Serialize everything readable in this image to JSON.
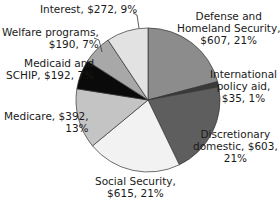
{
  "chart_data": {
    "type": "pie",
    "title": "",
    "start_angle": "12 o'clock, clockwise",
    "slices": [
      {
        "label": "Defense and Homeland Security",
        "value": 607,
        "percent": 21,
        "color": "#8c8c8c"
      },
      {
        "label": "International policy aid",
        "value": 35,
        "percent": 1,
        "color": "#3a3a3a"
      },
      {
        "label": "Discretionary domestic",
        "value": 603,
        "percent": 21,
        "color": "#5e5e5e"
      },
      {
        "label": "Social Security",
        "value": 615,
        "percent": 21,
        "color": "#f2f2f2"
      },
      {
        "label": "Medicare",
        "value": 392,
        "percent": 13,
        "color": "#c4c4c4"
      },
      {
        "label": "Medicaid and SCHIP",
        "value": 192,
        "percent": 7,
        "color": "#0a0a0a"
      },
      {
        "label": "Welfare programs",
        "value": 190,
        "percent": 7,
        "color": "#a8a8a8"
      },
      {
        "label": "Interest",
        "value": 272,
        "percent": 9,
        "color": "#e2e2e2"
      }
    ]
  },
  "labels": {
    "defense": [
      "Defense and",
      "Homeland Security,",
      "$607, 21%"
    ],
    "international": [
      "International",
      "policy aid,",
      "$35, 1%"
    ],
    "discretionary": [
      "Discretionary",
      "domestic, $603,",
      "21%"
    ],
    "social_security": [
      "Social Security,",
      "$615, 21%"
    ],
    "medicare": [
      "Medicare, $392,",
      "13%"
    ],
    "medicaid": [
      "Medicaid and",
      "SCHIP, $192, 7%"
    ],
    "welfare": [
      "Welfare programs,",
      "$190, 7%"
    ],
    "interest": [
      "Interest, $272, 9%"
    ]
  }
}
